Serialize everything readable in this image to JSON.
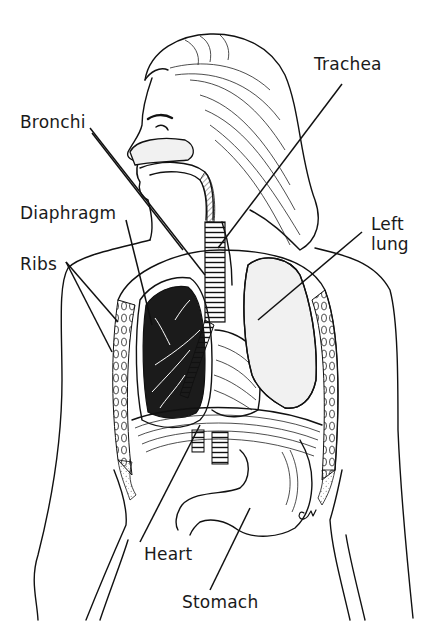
{
  "diagram": {
    "type": "anatomical illustration",
    "background_color": "#ffffff",
    "ink_color": "#111111",
    "labels": [
      {
        "id": "trachea",
        "text": "Trachea",
        "x": 314,
        "y": 64
      },
      {
        "id": "bronchi",
        "text": "Bronchi",
        "x": 20,
        "y": 114
      },
      {
        "id": "diaphragm",
        "text": "Diaphragm",
        "x": 20,
        "y": 203
      },
      {
        "id": "left-lung",
        "text": "Left\nlung",
        "x": 371,
        "y": 209
      },
      {
        "id": "ribs",
        "text": "Ribs",
        "x": 20,
        "y": 252
      },
      {
        "id": "heart",
        "text": "Heart",
        "x": 144,
        "y": 544
      },
      {
        "id": "stomach",
        "text": "Stomach",
        "x": 182,
        "y": 592
      }
    ],
    "artist_signature": "CM"
  }
}
